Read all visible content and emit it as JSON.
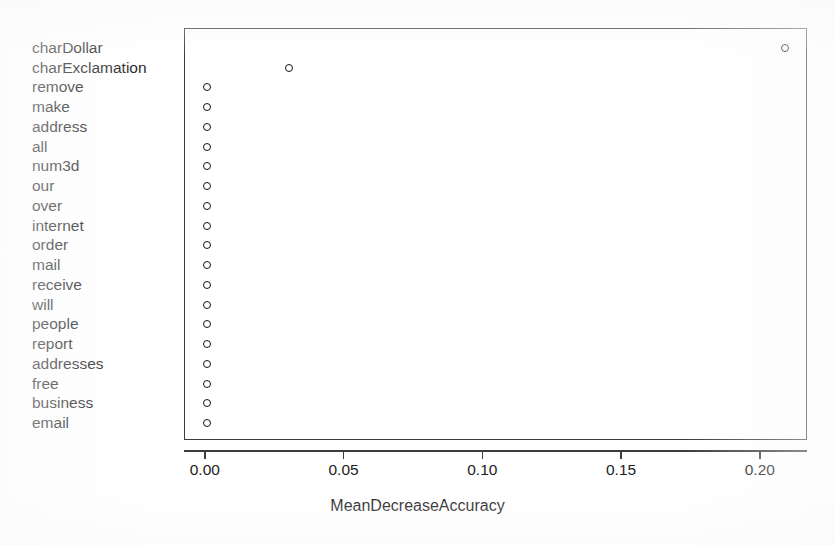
{
  "chart_data": {
    "type": "scatter",
    "title": "",
    "xlabel": "MeanDecreaseAccuracy",
    "ylabel": "",
    "xlim": [
      -0.0075,
      0.217
    ],
    "xticks": [
      0.0,
      0.05,
      0.1,
      0.15,
      0.2
    ],
    "xtick_labels": [
      "0.00",
      "0.05",
      "0.10",
      "0.15",
      "0.20"
    ],
    "grid": false,
    "legend": null,
    "marker": "open-circle",
    "marker_color": "#141414",
    "categories": [
      "charDollar",
      "charExclamation",
      "remove",
      "make",
      "address",
      "all",
      "num3d",
      "our",
      "over",
      "internet",
      "order",
      "mail",
      "receive",
      "will",
      "people",
      "report",
      "addresses",
      "free",
      "business",
      "email"
    ],
    "values": [
      0.2091,
      0.0303,
      0.0008,
      0.0008,
      0.0008,
      0.0008,
      0.0008,
      0.0008,
      0.0008,
      0.0008,
      0.0008,
      0.0008,
      0.0008,
      0.0008,
      0.0008,
      0.0008,
      0.0008,
      0.0008,
      0.0008,
      0.0008
    ]
  },
  "axis_title": "MeanDecreaseAccuracy",
  "cropped_title": ""
}
